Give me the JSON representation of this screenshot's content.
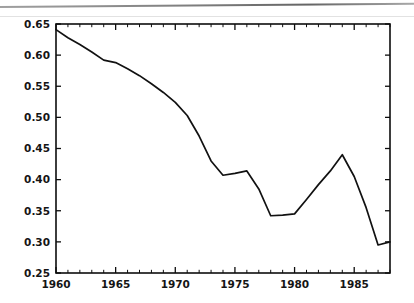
{
  "chart_data": {
    "type": "line",
    "title": "",
    "subtitle": "",
    "xlabel": "",
    "ylabel": "",
    "xlim": [
      1960,
      1988
    ],
    "ylim": [
      0.25,
      0.65
    ],
    "grid": false,
    "legend": null,
    "y_ticks": [
      0.25,
      0.3,
      0.35,
      0.4,
      0.45,
      0.5,
      0.55,
      0.6,
      0.65
    ],
    "y_tick_labels": [
      "0.25",
      "0.30",
      "0.35",
      "0.40",
      "0.45",
      "0.50",
      "0.55",
      "0.60",
      "0.65"
    ],
    "x_ticks": [
      1960,
      1965,
      1970,
      1975,
      1980,
      1985
    ],
    "x_tick_labels": [
      "1960",
      "1965",
      "1970",
      "1975",
      "1980",
      "1985"
    ],
    "x_minor_tick_interval": 1,
    "line_color": "#111111",
    "series": [
      {
        "name": "series-1",
        "x": [
          1960,
          1961,
          1962,
          1963,
          1964,
          1965,
          1966,
          1967,
          1968,
          1969,
          1970,
          1971,
          1972,
          1973,
          1974,
          1975,
          1976,
          1977,
          1978,
          1979,
          1980,
          1981,
          1982,
          1983,
          1984,
          1985,
          1986,
          1987,
          1988
        ],
        "values": [
          0.641,
          0.628,
          0.617,
          0.605,
          0.592,
          0.588,
          0.578,
          0.567,
          0.554,
          0.54,
          0.524,
          0.503,
          0.47,
          0.43,
          0.407,
          0.41,
          0.414,
          0.385,
          0.342,
          0.343,
          0.345,
          0.368,
          0.392,
          0.414,
          0.44,
          0.405,
          0.355,
          0.295,
          0.3
        ]
      }
    ]
  },
  "axis": {
    "y_label_0": "0.65",
    "y_label_1": "0.60",
    "y_label_2": "0.55",
    "y_label_3": "0.50",
    "y_label_4": "0.45",
    "y_label_5": "0.40",
    "y_label_6": "0.35",
    "y_label_7": "0.30",
    "y_label_8": "0.25"
  }
}
